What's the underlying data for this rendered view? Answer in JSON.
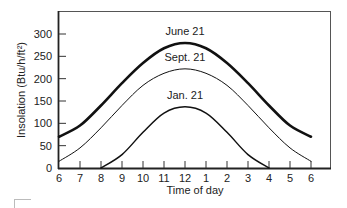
{
  "chart_data": {
    "type": "line",
    "title": "",
    "xlabel": "Time of day",
    "ylabel": "Insolation (Btu/h/ft²)",
    "x_ticks": [
      {
        "value": 6,
        "label": "6"
      },
      {
        "value": 7,
        "label": "7"
      },
      {
        "value": 8,
        "label": "8"
      },
      {
        "value": 9,
        "label": "9"
      },
      {
        "value": 10,
        "label": "10"
      },
      {
        "value": 11,
        "label": "11"
      },
      {
        "value": 12,
        "label": "12"
      },
      {
        "value": 13,
        "label": "1"
      },
      {
        "value": 14,
        "label": "2"
      },
      {
        "value": 15,
        "label": "3"
      },
      {
        "value": 16,
        "label": "4"
      },
      {
        "value": 17,
        "label": "5"
      },
      {
        "value": 18,
        "label": "6"
      }
    ],
    "y_ticks": [
      0,
      50,
      100,
      150,
      200,
      250,
      300
    ],
    "xlim": [
      6,
      19.5
    ],
    "ylim": [
      0,
      350
    ],
    "grid": false,
    "legend": "inline-labels",
    "series": [
      {
        "name": "June 21",
        "weight": "heavy",
        "x": [
          6,
          7,
          8,
          9,
          10,
          11,
          12,
          13,
          14,
          15,
          16,
          17,
          18
        ],
        "values": [
          70,
          95,
          140,
          190,
          235,
          268,
          280,
          268,
          235,
          190,
          140,
          95,
          70
        ]
      },
      {
        "name": "Sept. 21",
        "weight": "light",
        "x": [
          6,
          7,
          8,
          9,
          10,
          11,
          12,
          13,
          14,
          15,
          16,
          17,
          18
        ],
        "values": [
          15,
          45,
          90,
          140,
          185,
          212,
          222,
          212,
          185,
          140,
          90,
          45,
          15
        ]
      },
      {
        "name": "Jan. 21",
        "weight": "medium",
        "x": [
          8,
          9,
          10,
          11,
          12,
          13,
          14,
          15,
          16
        ],
        "values": [
          0,
          30,
          80,
          123,
          137,
          123,
          80,
          30,
          0
        ]
      }
    ]
  }
}
